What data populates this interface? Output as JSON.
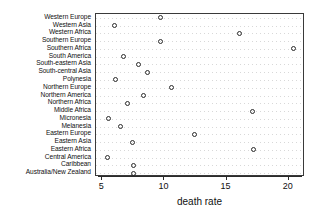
{
  "chart_data": {
    "type": "scatter",
    "title": "",
    "xlabel": "death rate",
    "ylabel": "",
    "xlim": [
      4.5,
      21.3
    ],
    "ylim_categories": true,
    "grid": "dotted-horizontal",
    "legend": "none",
    "x_ticks": [
      {
        "value": 5,
        "label": "5"
      },
      {
        "value": 10,
        "label": "10"
      },
      {
        "value": 15,
        "label": "15"
      },
      {
        "value": 20,
        "label": "20"
      }
    ],
    "categories": [
      "Western Europe",
      "Western Asia",
      "Western Africa",
      "Southern Europe",
      "Southern Africa",
      "South America",
      "South-eastern Asia",
      "South-central Asia",
      "Polynesia",
      "Northern Europe",
      "Northern America",
      "Northern Africa",
      "Middle Africa",
      "Micronesia",
      "Melanesia",
      "Eastern Europe",
      "Eastern Asia",
      "Eastern Africa",
      "Central America",
      "Caribbean",
      "Australia/New Zealand"
    ],
    "values": [
      9.7,
      6.0,
      16.0,
      9.7,
      20.4,
      6.7,
      7.9,
      8.6,
      6.1,
      10.6,
      8.3,
      7.0,
      17.1,
      5.5,
      6.5,
      12.4,
      7.4,
      17.2,
      5.4,
      7.5,
      7.5
    ],
    "points": [
      {
        "category": "Western Europe",
        "value": 9.7
      },
      {
        "category": "Western Asia",
        "value": 6.0
      },
      {
        "category": "Western Africa",
        "value": 16.0
      },
      {
        "category": "Southern Europe",
        "value": 9.7
      },
      {
        "category": "Southern Africa",
        "value": 20.4
      },
      {
        "category": "South America",
        "value": 6.7
      },
      {
        "category": "South-eastern Asia",
        "value": 7.9
      },
      {
        "category": "South-central Asia",
        "value": 8.6
      },
      {
        "category": "Polynesia",
        "value": 6.1
      },
      {
        "category": "Northern Europe",
        "value": 10.6
      },
      {
        "category": "Northern America",
        "value": 8.3
      },
      {
        "category": "Northern Africa",
        "value": 7.0
      },
      {
        "category": "Middle Africa",
        "value": 17.1
      },
      {
        "category": "Micronesia",
        "value": 5.5
      },
      {
        "category": "Melanesia",
        "value": 6.5
      },
      {
        "category": "Eastern Europe",
        "value": 12.4
      },
      {
        "category": "Eastern Asia",
        "value": 7.4
      },
      {
        "category": "Eastern Africa",
        "value": 17.2
      },
      {
        "category": "Central America",
        "value": 5.4
      },
      {
        "category": "Caribbean",
        "value": 7.5
      },
      {
        "category": "Australia/New Zealand",
        "value": 7.5
      }
    ],
    "marker": {
      "shape": "circle-open",
      "color": "#2b2b2b",
      "size": 5
    },
    "colors": {
      "background": "#ffffff",
      "axis": "#2b2b2b",
      "grid": "#d8d8d8",
      "text": "#101010"
    }
  }
}
